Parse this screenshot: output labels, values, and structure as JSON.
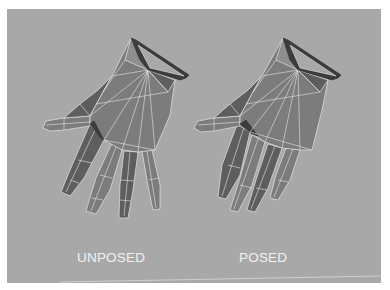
{
  "figure": {
    "background_color": "#a8a8a8",
    "page_color": "#ffffff",
    "mesh_fill_color": "#7c7c7c",
    "mesh_dark_color": "#4a4a4a",
    "wireframe_color": "#e6e6e6",
    "panels": [
      {
        "id": "unposed",
        "label": "UNPOSED",
        "description": "Low-poly 3D hand mesh, fingers spread (rest pose)"
      },
      {
        "id": "posed",
        "label": "POSED",
        "description": "Low-poly 3D hand mesh, fingers curled (posed)"
      }
    ]
  }
}
